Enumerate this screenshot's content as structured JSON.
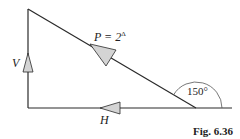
{
  "figure": {
    "caption": "Fig. 6.36",
    "labels": {
      "force_p": "P = 2",
      "force_p_superscript": "Δ",
      "force_v": "V",
      "force_h": "H",
      "angle": "150°"
    },
    "colors": {
      "line": "#2a2a2a",
      "arrow_fill": "#d4d4d4",
      "arc": "#555555"
    }
  }
}
